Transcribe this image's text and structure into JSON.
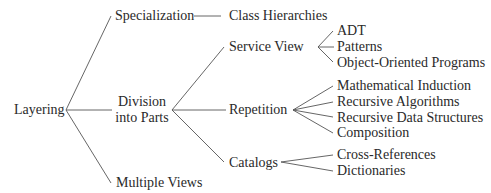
{
  "colors": {
    "line": "#555555",
    "text": "#2a2a2a",
    "background": "#ffffff"
  },
  "nodes": {
    "layering": "Layering",
    "specialization": "Specialization",
    "class_hierarchies": "Class Hierarchies",
    "division_line1": "Division",
    "division_line2": "into Parts",
    "multiple_views": "Multiple Views",
    "service_view": "Service View",
    "adt": "ADT",
    "patterns": "Patterns",
    "oop": "Object-Oriented Programs",
    "repetition": "Repetition",
    "math_induction": "Mathematical Induction",
    "rec_algorithms": "Recursive Algorithms",
    "rec_data": "Recursive Data Structures",
    "composition": "Composition",
    "catalogs": "Catalogs",
    "cross_refs": "Cross-References",
    "dictionaries": "Dictionaries"
  },
  "edges": [
    [
      "Layering",
      "Specialization"
    ],
    [
      "Layering",
      "Division into Parts"
    ],
    [
      "Layering",
      "Multiple Views"
    ],
    [
      "Specialization",
      "Class Hierarchies"
    ],
    [
      "Division into Parts",
      "Service View"
    ],
    [
      "Division into Parts",
      "Repetition"
    ],
    [
      "Division into Parts",
      "Catalogs"
    ],
    [
      "Service View",
      "ADT"
    ],
    [
      "Service View",
      "Patterns"
    ],
    [
      "Service View",
      "Object-Oriented Programs"
    ],
    [
      "Repetition",
      "Mathematical Induction"
    ],
    [
      "Repetition",
      "Recursive Algorithms"
    ],
    [
      "Repetition",
      "Recursive Data Structures"
    ],
    [
      "Repetition",
      "Composition"
    ],
    [
      "Catalogs",
      "Cross-References"
    ],
    [
      "Catalogs",
      "Dictionaries"
    ]
  ]
}
